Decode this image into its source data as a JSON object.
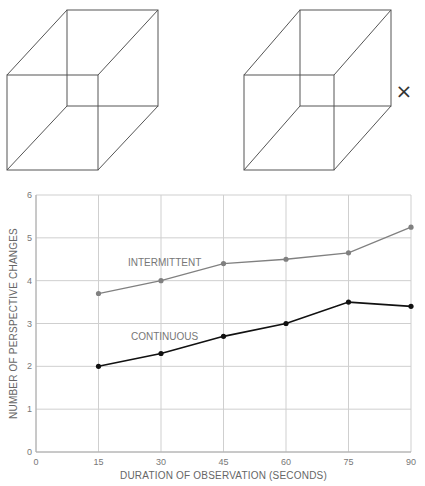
{
  "figures": {
    "cube_left": {
      "label": "necker-cube-left"
    },
    "cube_right": {
      "label": "necker-cube-right",
      "marker": "×"
    }
  },
  "chart_data": {
    "type": "line",
    "title": "",
    "xlabel": "DURATION OF OBSERVATION (SECONDS)",
    "ylabel": "NUMBER OF PERSPECTIVE CHANGES",
    "x": [
      15,
      30,
      45,
      60,
      75,
      90
    ],
    "xticks": [
      "0",
      "15",
      "30",
      "45",
      "60",
      "75",
      "90"
    ],
    "yticks": [
      "0",
      "1",
      "2",
      "3",
      "4",
      "5",
      "6"
    ],
    "xlim": [
      0,
      90
    ],
    "ylim": [
      0,
      6
    ],
    "grid": true,
    "legend": "inline labels",
    "series": [
      {
        "name": "INTERMITTENT",
        "values": [
          3.7,
          4.0,
          4.4,
          4.5,
          4.65,
          5.25
        ],
        "color": "#808080"
      },
      {
        "name": "CONTINUOUS",
        "values": [
          2.0,
          2.3,
          2.7,
          3.0,
          3.5,
          3.4
        ],
        "color": "#111111"
      }
    ]
  }
}
